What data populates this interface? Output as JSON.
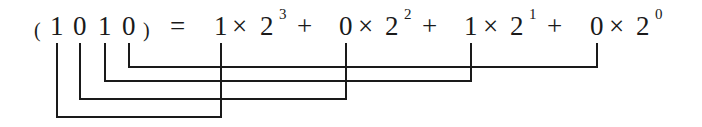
{
  "equation": {
    "lhs": {
      "open_paren": "(",
      "digits": [
        "1",
        "0",
        "1",
        "0"
      ],
      "close_paren": ")"
    },
    "equals": "=",
    "terms": [
      {
        "coef": "1",
        "times": "×",
        "base": "2",
        "exp": "3",
        "plus": "+"
      },
      {
        "coef": "0",
        "times": "×",
        "base": "2",
        "exp": "2",
        "plus": "+"
      },
      {
        "coef": "1",
        "times": "×",
        "base": "2",
        "exp": "1",
        "plus": "+"
      },
      {
        "coef": "0",
        "times": "×",
        "base": "2",
        "exp": "0",
        "plus": ""
      }
    ]
  },
  "connectors": [
    {
      "from_digit_index": 0,
      "to_term_index": 0,
      "description": "1 → 1×2^3"
    },
    {
      "from_digit_index": 1,
      "to_term_index": 1,
      "description": "0 → 0×2^2"
    },
    {
      "from_digit_index": 2,
      "to_term_index": 2,
      "description": "1 → 1×2^1"
    },
    {
      "from_digit_index": 3,
      "to_term_index": 3,
      "description": "0 → 0×2^0"
    }
  ],
  "colors": {
    "line": "#1a1a1a",
    "text": "#1a1a1a",
    "background": "#ffffff"
  }
}
